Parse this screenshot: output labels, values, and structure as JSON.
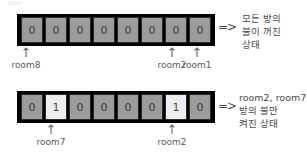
{
  "diagrams": [
    {
      "name": "all-lights-off",
      "cells": [
        "0",
        "0",
        "0",
        "0",
        "0",
        "0",
        "0",
        "0"
      ],
      "on_flags": [
        false,
        false,
        false,
        false,
        false,
        false,
        false,
        false
      ],
      "implies_symbol": "=>",
      "markers": [
        {
          "cell_index": 0,
          "arrow": "↑",
          "label": "room8"
        },
        {
          "cell_index": 6,
          "arrow": "↑",
          "label": "room2"
        },
        {
          "cell_index": 7,
          "arrow": "↑",
          "label": "room1"
        }
      ],
      "note_lines": [
        "모든 방의",
        "불이 꺼진",
        "상태"
      ]
    },
    {
      "name": "room2-room7-lights-on",
      "cells": [
        "0",
        "1",
        "0",
        "0",
        "0",
        "0",
        "1",
        "0"
      ],
      "on_flags": [
        false,
        true,
        false,
        false,
        false,
        false,
        true,
        false
      ],
      "implies_symbol": "=>",
      "markers": [
        {
          "cell_index": 1,
          "arrow": "↑",
          "label": "room7"
        },
        {
          "cell_index": 6,
          "arrow": "↑",
          "label": "room2"
        }
      ],
      "note_lines": [
        "room2, room7",
        "방의 불만",
        "켜진 상태"
      ]
    }
  ],
  "colors": {
    "cell_off": "#9c9c9c",
    "cell_on": "#ededed",
    "border": "#000000",
    "text": "#4a4a4a"
  }
}
